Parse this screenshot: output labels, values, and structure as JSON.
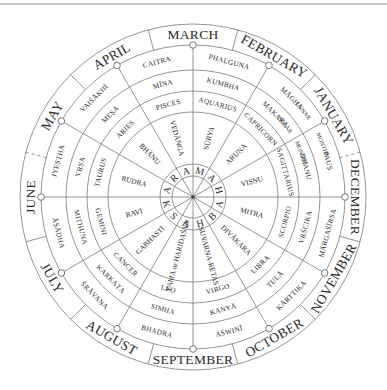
{
  "geometry": {
    "cx": 193,
    "cy": 197,
    "r_outer": 173,
    "r_month": 152,
    "r_lunar": 127,
    "r_solar": 106,
    "r_zodiac": 85,
    "r_core_outer": 33,
    "r_core_inner": 21
  },
  "colors": {
    "line": "#7a7a7a",
    "text": "#2a2a2a",
    "background": "#ffffff"
  },
  "ring_labels": {
    "lunar": "LUNAR",
    "solar": "SOLAR",
    "months_a": "MONTHS",
    "months_b": "MONTHS"
  },
  "center_word": [
    "M",
    "A",
    "H",
    "A",
    "B",
    "H",
    "A",
    "S",
    "K",
    "A",
    "R",
    "A"
  ],
  "months": [
    "MARCH",
    "FEBRUARY",
    "JANUARY",
    "DECEMBER",
    "NOVEMBER",
    "OCTOBER",
    "SEPTEMBER",
    "AUGUST",
    "JULY",
    "JUNE",
    "MAY",
    "APRIL"
  ],
  "sectors": [
    {
      "lunar": "PHALGUNA",
      "solar": "KUMBHA",
      "zodiac": "AQUARIUS",
      "aditya": "SŪRYA"
    },
    {
      "lunar": "MĀGHA",
      "solar": "MAKARA",
      "zodiac": "CAPRICORN",
      "aditya": "ARUṆA"
    },
    {
      "lunar": "PAUṢ",
      "solar": "DHANU",
      "zodiac": "SAGITTARIUS",
      "aditya": "VIṢṆU"
    },
    {
      "lunar": "MĀRGAŚĪRṢA",
      "solar": "VṚŚCIKA",
      "zodiac": "SCORPIO",
      "aditya": "MITRA"
    },
    {
      "lunar": "KĀRTTIKA",
      "solar": "TULĀ",
      "zodiac": "LIBRA",
      "aditya": "DIVĀKARA"
    },
    {
      "lunar": "ĀŚWINĪ",
      "solar": "KANYĀ",
      "zodiac": "VIRGO",
      "aditya": "SUVARṆA-RETAS"
    },
    {
      "lunar": "BHADRA",
      "solar": "SIMHA",
      "zodiac": "LEO",
      "aditya": "YAMA or HARIDAŚVA"
    },
    {
      "lunar": "ŚRĀVAṆA",
      "solar": "KARKAṬA",
      "zodiac": "CANCER",
      "aditya": "GABHASTI"
    },
    {
      "lunar": "ĀṢĀḌHA",
      "solar": "MITHUNA",
      "zodiac": "GEMINI",
      "aditya": "RAVI"
    },
    {
      "lunar": "JYEṢṬHA",
      "solar": "VṚṢA",
      "zodiac": "TAURUS",
      "aditya": "RUDRA"
    },
    {
      "lunar": "VAIŚĀKHĪ",
      "solar": "MEṢA",
      "zodiac": "ARIES",
      "aditya": "BHĀNU"
    },
    {
      "lunar": "CAITRA",
      "solar": "MĪNA",
      "zodiac": "PISCES",
      "aditya": "VEDĀṄGA"
    }
  ]
}
